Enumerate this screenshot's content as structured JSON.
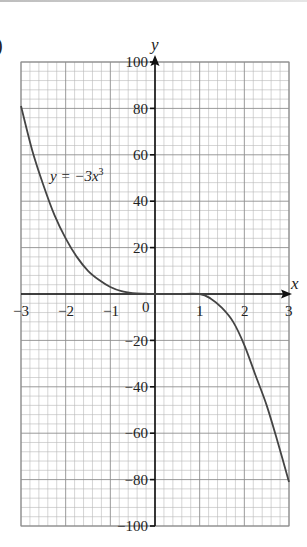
{
  "part_label": ")",
  "chart_data": {
    "type": "line",
    "title": "",
    "xlabel": "x",
    "ylabel": "y",
    "xlim": [
      -3,
      3
    ],
    "ylim": [
      -100,
      100
    ],
    "grid": true,
    "grid_minor_divisions": 5,
    "x_ticks": [
      "-3",
      "-2",
      "-1",
      "0",
      "1",
      "2",
      "3"
    ],
    "y_ticks": [
      "100",
      "80",
      "60",
      "40",
      "20",
      "-20",
      "-40",
      "-60",
      "-80",
      "-100"
    ],
    "series": [
      {
        "name": "y = -3x³",
        "label": "y = −3x",
        "label_superscript": "3",
        "x": [
          -3,
          -2.75,
          -2.5,
          -2.25,
          -2,
          -1.75,
          -1.5,
          -1.25,
          -1,
          -0.75,
          -0.5,
          -0.25,
          0,
          0.5,
          1,
          1.25,
          1.5,
          1.75,
          2,
          2.25,
          2.5,
          2.75,
          3
        ],
        "y": [
          81,
          62,
          47,
          34,
          24,
          16,
          10,
          6,
          3,
          1.2,
          0.4,
          0.1,
          0,
          0,
          0,
          -2,
          -6,
          -12,
          -22,
          -35,
          -48,
          -64,
          -81
        ]
      }
    ],
    "legend": "none",
    "annotations": [
      "y = −3x³"
    ]
  },
  "labels": {
    "x_axis_name": "x",
    "y_axis_name": "y",
    "zero": "0",
    "x_neg3": "−3",
    "x_neg2": "−2",
    "x_neg1": "−1",
    "x_1": "1",
    "x_2": "2",
    "x_3": "3",
    "y_100": "100",
    "y_80": "80",
    "y_60": "60",
    "y_40": "40",
    "y_20": "20",
    "y_neg20": "−20",
    "y_neg40": "−40",
    "y_neg60": "−60",
    "y_neg80": "−80",
    "y_neg100": "−100",
    "curve_main": "y = −3x",
    "curve_sup": "3"
  },
  "colors": {
    "grid_minor": "#b9b9b9",
    "grid_major": "#8e8e8e",
    "axis": "#111111",
    "curve": "#444444"
  }
}
